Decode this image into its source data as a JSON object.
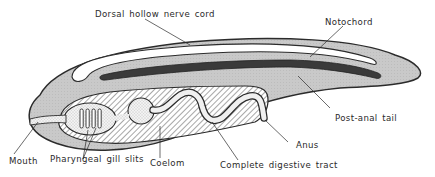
{
  "diagram": {
    "colors": {
      "body_fill": "#c8c8c8",
      "outline": "#2b2b2b",
      "nerve_cord": "#ffffff",
      "notochord": "#3a3a3a",
      "gut_fill": "#e6e6e6",
      "hatch": "#6a6a6a",
      "background": "#ffffff",
      "text": "#2a2a2a"
    },
    "labels": {
      "dorsal_nerve_cord": "Dorsal hollow nerve cord",
      "notochord": "Notochord",
      "post_anal_tail": "Post-anal tail",
      "anus": "Anus",
      "complete_digestive_tract": "Complete digestive tract",
      "coelom": "Coelom",
      "pharyngeal_gill_slits": "Pharyngeal gill slits",
      "mouth": "Mouth"
    }
  }
}
